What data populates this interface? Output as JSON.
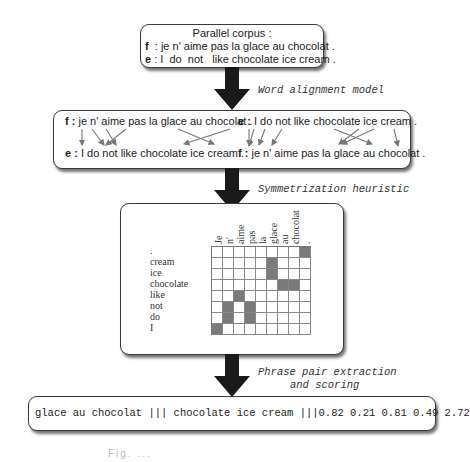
{
  "box1": {
    "title": "Parallel corpus :",
    "f_tag": "f",
    "f_text": "  : je n' aime pas la glace au chocolat .",
    "e_tag": "e",
    "e_text": " : I  do  not   like chocolate ice cream ."
  },
  "step1_label": "Word alignment model",
  "box2": {
    "left": {
      "top_tag": "f :",
      "top_text": " je n' aime pas la glace au chocolat .",
      "bottom_tag": "e :",
      "bottom_text": " I do not like chocolate ice cream ."
    },
    "right": {
      "top_tag": "e :",
      "top_text": " I do not like chocolate ice cream .",
      "bottom_tag": "f :",
      "bottom_text": " je n' aime pas la glace au chocolat ."
    }
  },
  "step2_label": "Symmetrization heuristic",
  "matrix": {
    "columns": [
      "Je",
      "n'",
      "aime",
      "pas",
      "la",
      "glace",
      "au",
      "chocolat",
      "."
    ],
    "rows": [
      ".",
      "cream",
      "ice",
      "chocolate",
      "like",
      "not",
      "do",
      "I"
    ],
    "filled": [
      [
        0,
        8
      ],
      [
        1,
        5
      ],
      [
        2,
        5
      ],
      [
        3,
        6
      ],
      [
        3,
        7
      ],
      [
        4,
        2
      ],
      [
        5,
        1
      ],
      [
        5,
        3
      ],
      [
        6,
        1
      ],
      [
        6,
        3
      ],
      [
        7,
        0
      ]
    ],
    "fill_color": "#7a7a7a"
  },
  "step3_label_line1": "Phrase pair extraction",
  "step3_label_line2": "and scoring",
  "box4": {
    "text": "glace au chocolat ||| chocolate ice cream |||0.82 0.21 0.81 0.49 2.72"
  },
  "caption": "Fig. ..."
}
